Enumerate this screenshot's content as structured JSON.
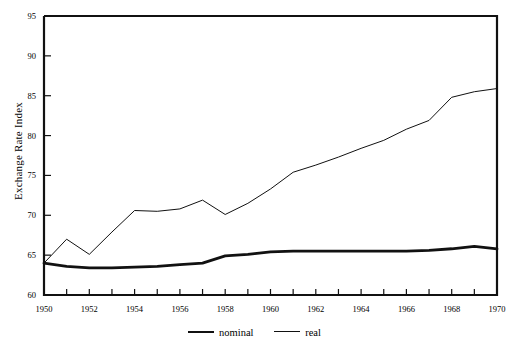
{
  "chart_data": {
    "type": "line",
    "title": "",
    "xlabel": "",
    "ylabel": "Exchange Rate Index",
    "xlim": [
      1950,
      1970
    ],
    "ylim": [
      60,
      95
    ],
    "grid": false,
    "legend_position": "bottom-center",
    "x": [
      1950,
      1951,
      1952,
      1953,
      1954,
      1955,
      1956,
      1957,
      1958,
      1959,
      1960,
      1961,
      1962,
      1963,
      1964,
      1965,
      1966,
      1967,
      1968,
      1969,
      1970
    ],
    "series": [
      {
        "name": "nominal",
        "style": "thick",
        "color": "#111111",
        "values": [
          64.0,
          63.6,
          63.4,
          63.4,
          63.5,
          63.6,
          63.8,
          64.0,
          64.9,
          65.1,
          65.4,
          65.5,
          65.5,
          65.5,
          65.5,
          65.5,
          65.5,
          65.6,
          65.8,
          66.1,
          65.8
        ]
      },
      {
        "name": "real",
        "style": "thin",
        "color": "#111111",
        "values": [
          64.0,
          67.0,
          65.1,
          67.9,
          70.6,
          70.5,
          70.8,
          71.9,
          70.1,
          71.5,
          73.3,
          75.4,
          76.3,
          77.3,
          78.4,
          79.4,
          80.8,
          81.9,
          84.8,
          85.5,
          85.9
        ]
      }
    ],
    "y_ticks": [
      60,
      65,
      70,
      75,
      80,
      85,
      90,
      95
    ],
    "x_ticks_labeled": [
      1950,
      1952,
      1954,
      1956,
      1958,
      1960,
      1962,
      1964,
      1966,
      1968,
      1970
    ],
    "x_ticks_minor_step": 1,
    "axis_color": "#111111",
    "background": "#ffffff"
  },
  "legend": {
    "entries": [
      {
        "label": "nominal"
      },
      {
        "label": "real"
      }
    ]
  }
}
